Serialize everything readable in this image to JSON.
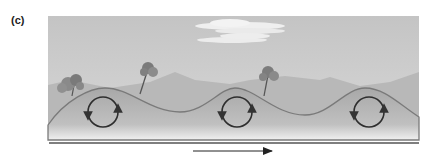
{
  "figure": {
    "panel_label": "(c)",
    "circulation_cells": [
      {
        "position": "left-crest",
        "rotation": "circular"
      },
      {
        "position": "middle-crest",
        "rotation": "circular"
      },
      {
        "position": "right-crest",
        "rotation": "circular"
      }
    ],
    "flow_arrow": {
      "direction": "right"
    },
    "colors": {
      "sky": "#c8c8c8",
      "mountains": "#b4b4b4",
      "ground": "#a9a9a9",
      "ground_edge": "#808080",
      "circle": "#333333",
      "baseline": "#555555",
      "cloud": "#efefef"
    }
  }
}
